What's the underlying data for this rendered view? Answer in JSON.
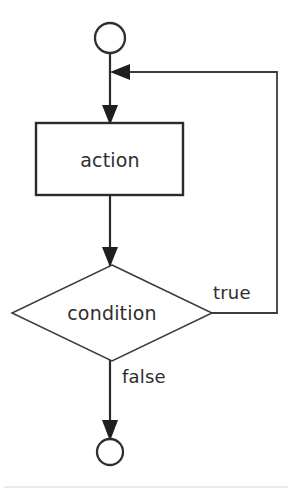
{
  "diagram": {
    "type": "flowchart",
    "canvas": {
      "width": 292,
      "height": 494,
      "background": "#ffffff"
    },
    "colors": {
      "stroke": "#2b2b2b",
      "fill": "#ffffff",
      "text": "#2e2e2e",
      "arrow": "#1f1f1f",
      "rule": "#d8d8d8"
    },
    "nodes": [
      {
        "id": "start",
        "kind": "start-terminator",
        "shape": "circle",
        "label": "",
        "cx": 110,
        "cy": 38,
        "r": 15
      },
      {
        "id": "action",
        "kind": "process",
        "shape": "rectangle",
        "label": "action",
        "x": 36,
        "y": 123,
        "width": 147,
        "height": 72
      },
      {
        "id": "condition",
        "kind": "decision",
        "shape": "diamond",
        "label": "condition",
        "cx": 112,
        "cy": 313,
        "half_width": 100,
        "half_height": 48
      },
      {
        "id": "end",
        "kind": "end-terminator",
        "shape": "circle",
        "label": "",
        "cx": 110,
        "cy": 452,
        "r": 13
      }
    ],
    "edges": [
      {
        "id": "start-to-action",
        "from": "start",
        "to": "action",
        "label": "",
        "arrow": "down"
      },
      {
        "id": "action-to-condition",
        "from": "action",
        "to": "condition",
        "label": "",
        "arrow": "down"
      },
      {
        "id": "condition-true-loop",
        "from": "condition",
        "to": "start-to-action",
        "label": "true",
        "arrow": "left",
        "label_x": 213,
        "label_y": 294
      },
      {
        "id": "condition-false-exit",
        "from": "condition",
        "to": "end",
        "label": "false",
        "arrow": "down",
        "label_x": 122,
        "label_y": 378
      }
    ]
  }
}
